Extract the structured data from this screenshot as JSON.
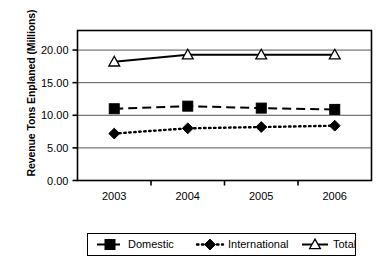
{
  "chart_data": {
    "type": "line",
    "title": "",
    "xlabel": "",
    "ylabel": "Revenue Tons Enplaned (Millions)",
    "categories": [
      "2003",
      "2004",
      "2005",
      "2006"
    ],
    "ylim": [
      0.0,
      23.0
    ],
    "yticks": [
      0.0,
      5.0,
      10.0,
      15.0,
      20.0
    ],
    "ytick_labels": [
      "0.00",
      "5.00",
      "10.00",
      "15.00",
      "20.00"
    ],
    "grid": "horizontal",
    "legend_position": "bottom",
    "series": [
      {
        "name": "Domestic",
        "values": [
          11.0,
          11.4,
          11.1,
          10.9
        ],
        "marker": "filled-square",
        "line_style": "dashed",
        "color": "#000000"
      },
      {
        "name": "International",
        "values": [
          7.2,
          8.0,
          8.2,
          8.4
        ],
        "marker": "filled-diamond",
        "line_style": "dotted",
        "color": "#000000"
      },
      {
        "name": "Total",
        "values": [
          18.2,
          19.3,
          19.3,
          19.3
        ],
        "marker": "open-triangle",
        "line_style": "solid",
        "color": "#000000"
      }
    ],
    "legend_entries": [
      "Domestic",
      "International",
      "Total"
    ]
  }
}
